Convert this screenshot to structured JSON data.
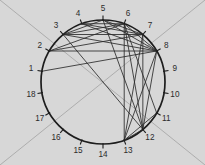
{
  "figure": {
    "width": 205,
    "height": 165,
    "background_color": "#d7d7d7",
    "node_color": "#1d1d1d",
    "edge_color": "#2a2a2a",
    "guide_color": "#a8a8a8",
    "label_color": "#2b2b2b"
  },
  "circle": {
    "center_x": 103,
    "center_y": 82,
    "radius": 62,
    "node_count": 18,
    "start_angle_deg": 190,
    "direction": "clockwise"
  },
  "background_guides": [
    {
      "name": "diagonal-tl-br",
      "x1": 0,
      "y1": 0,
      "x2": 205,
      "y2": 165
    },
    {
      "name": "diagonal-tr-bl",
      "x1": 205,
      "y1": 0,
      "x2": 0,
      "y2": 165
    }
  ],
  "nodes": [
    {
      "id": 1,
      "label": "1",
      "angle_deg": 190
    },
    {
      "id": 2,
      "label": "2",
      "angle_deg": 210
    },
    {
      "id": 3,
      "label": "3",
      "angle_deg": 230
    },
    {
      "id": 4,
      "label": "4",
      "angle_deg": 250
    },
    {
      "id": 5,
      "label": "5",
      "angle_deg": 270
    },
    {
      "id": 6,
      "label": "6",
      "angle_deg": 290
    },
    {
      "id": 7,
      "label": "7",
      "angle_deg": 310
    },
    {
      "id": 8,
      "label": "8",
      "angle_deg": 330
    },
    {
      "id": 9,
      "label": "9",
      "angle_deg": 350
    },
    {
      "id": 10,
      "label": "10",
      "angle_deg": 10
    },
    {
      "id": 11,
      "label": "11",
      "angle_deg": 30
    },
    {
      "id": 12,
      "label": "12",
      "angle_deg": 50
    },
    {
      "id": 13,
      "label": "13",
      "angle_deg": 70
    },
    {
      "id": 14,
      "label": "14",
      "angle_deg": 90
    },
    {
      "id": 15,
      "label": "15",
      "angle_deg": 110
    },
    {
      "id": 16,
      "label": "16",
      "angle_deg": 130
    },
    {
      "id": 17,
      "label": "17",
      "angle_deg": 150
    },
    {
      "id": 18,
      "label": "18",
      "angle_deg": 170
    }
  ],
  "edges": [
    {
      "source": 1,
      "target": 8
    },
    {
      "source": 2,
      "target": 6
    },
    {
      "source": 2,
      "target": 7
    },
    {
      "source": 2,
      "target": 8
    },
    {
      "source": 3,
      "target": 5
    },
    {
      "source": 3,
      "target": 6
    },
    {
      "source": 3,
      "target": 7
    },
    {
      "source": 3,
      "target": 8
    },
    {
      "source": 3,
      "target": 12
    },
    {
      "source": 4,
      "target": 6
    },
    {
      "source": 4,
      "target": 7
    },
    {
      "source": 4,
      "target": 8
    },
    {
      "source": 5,
      "target": 7
    },
    {
      "source": 5,
      "target": 8
    },
    {
      "source": 5,
      "target": 12
    },
    {
      "source": 6,
      "target": 8
    },
    {
      "source": 6,
      "target": 12
    },
    {
      "source": 6,
      "target": 13
    },
    {
      "source": 6,
      "target": 11
    },
    {
      "source": 7,
      "target": 12
    },
    {
      "source": 7,
      "target": 13
    },
    {
      "source": 8,
      "target": 12
    },
    {
      "source": 8,
      "target": 13
    },
    {
      "source": 11,
      "target": 13
    },
    {
      "source": 12,
      "target": 13
    }
  ],
  "label_offsets": {
    "radial_distance": 11
  }
}
